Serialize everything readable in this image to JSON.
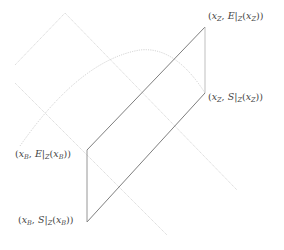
{
  "diagram": {
    "colors": {
      "main_line": "#6f6f6f",
      "light_line": "#c8c8c8",
      "arc": "#c4c4c4",
      "label": "#444444"
    },
    "points": {
      "xZ_E": {
        "x": 205,
        "y": 27
      },
      "xZ_S": {
        "x": 205,
        "y": 93
      },
      "xB_E": {
        "x": 87,
        "y": 150
      },
      "xB_S": {
        "x": 87,
        "y": 222
      }
    },
    "labels": {
      "xZ_E": {
        "open": "(",
        "x": "x",
        "xsub": "Z",
        "sep": ", ",
        "func": "E",
        "bar": "|",
        "bsub": "Z",
        "arg_open": "(",
        "ax": "x",
        "axsub": "Z",
        "close": "))"
      },
      "xZ_S": {
        "open": "(",
        "x": "x",
        "xsub": "Z",
        "sep": ", ",
        "func": "S",
        "bar": "|",
        "bsub": "Z",
        "arg_open": "(",
        "ax": "x",
        "axsub": "Z",
        "close": "))"
      },
      "xB_E": {
        "open": "(",
        "x": "x",
        "xsub": "B",
        "sep": ", ",
        "func": "E",
        "bar": "|",
        "bsub": "Z",
        "arg_open": "(",
        "ax": "x",
        "axsub": "B",
        "close": "))"
      },
      "xB_S": {
        "open": "(",
        "x": "x",
        "xsub": "B",
        "sep": ", ",
        "func": "S",
        "bar": "|",
        "bsub": "Z",
        "arg_open": "(",
        "ax": "x",
        "axsub": "B",
        "close": "))"
      }
    }
  }
}
